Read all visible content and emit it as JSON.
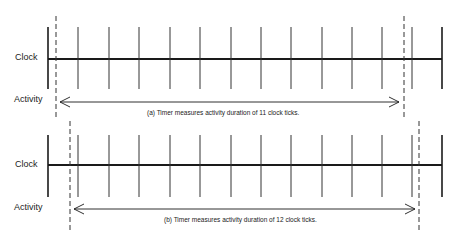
{
  "panels": [
    {
      "id": "a",
      "clock_label": "Clock",
      "activity_label": "Activity",
      "caption": "(a) Timer measures activity duration of 11 clock ticks.",
      "tick_count_measured": 11,
      "clock_y": 59,
      "tick_top": 27,
      "tick_bottom": 89,
      "dash_left_x": 56,
      "dash_right_x": 404,
      "dash_top": 16,
      "dash_bottom": 120,
      "arrow_y": 102,
      "arrow_x1": 60,
      "arrow_x2": 399
    },
    {
      "id": "b",
      "clock_label": "Clock",
      "activity_label": "Activity",
      "caption": "(b) Timer measures activity duration of 12 clock ticks.",
      "tick_count_measured": 12,
      "clock_y": 165,
      "tick_top": 135,
      "tick_bottom": 197,
      "dash_left_x": 70,
      "dash_right_x": 419,
      "dash_top": 121,
      "dash_bottom": 230,
      "arrow_y": 209,
      "arrow_x1": 74,
      "arrow_x2": 415
    }
  ],
  "clock": {
    "x_start": 48,
    "x_end": 442,
    "tick_x": [
      48,
      78,
      109,
      139,
      170,
      200,
      231,
      261,
      291,
      322,
      352,
      382,
      412,
      442
    ]
  },
  "colors": {
    "line": "#1a1a1a",
    "tick": "#333333",
    "dash": "#333333"
  }
}
